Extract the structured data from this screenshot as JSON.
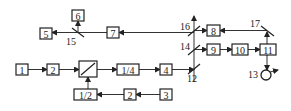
{
  "diagram": {
    "boxes": [
      {
        "id": "b1",
        "label": "1",
        "x": 16,
        "y": 64,
        "w": 12,
        "h": 11
      },
      {
        "id": "b2a",
        "label": "2",
        "x": 47,
        "y": 64,
        "w": 12,
        "h": 11
      },
      {
        "id": "b_pol",
        "label": "",
        "x": 79,
        "y": 61,
        "w": 18,
        "h": 16
      },
      {
        "id": "b_q",
        "label": "1/4",
        "x": 117,
        "y": 64,
        "w": 22,
        "h": 11
      },
      {
        "id": "b4",
        "label": "4",
        "x": 160,
        "y": 64,
        "w": 12,
        "h": 11
      },
      {
        "id": "b_h",
        "label": "1/2",
        "x": 74,
        "y": 89,
        "w": 23,
        "h": 11
      },
      {
        "id": "b2b",
        "label": "2",
        "x": 124,
        "y": 89,
        "w": 12,
        "h": 11
      },
      {
        "id": "b3",
        "label": "3",
        "x": 160,
        "y": 89,
        "w": 12,
        "h": 11
      },
      {
        "id": "b5",
        "label": "5",
        "x": 40,
        "y": 28,
        "w": 12,
        "h": 11
      },
      {
        "id": "b6",
        "label": "6",
        "x": 72,
        "y": 10,
        "w": 12,
        "h": 11
      },
      {
        "id": "b7",
        "label": "7",
        "x": 107,
        "y": 27,
        "w": 12,
        "h": 11
      },
      {
        "id": "b8",
        "label": "8",
        "x": 207,
        "y": 25,
        "w": 13,
        "h": 11
      },
      {
        "id": "b9",
        "label": "9",
        "x": 207,
        "y": 44,
        "w": 13,
        "h": 11
      },
      {
        "id": "b10",
        "label": "10",
        "x": 232,
        "y": 44,
        "w": 16,
        "h": 11
      },
      {
        "id": "b11",
        "label": "11",
        "x": 260,
        "y": 44,
        "w": 16,
        "h": 11
      }
    ],
    "labels": [
      {
        "id": "l12",
        "text": "12",
        "x": 187,
        "y": 82
      },
      {
        "id": "l13",
        "text": "13",
        "x": 248,
        "y": 78
      },
      {
        "id": "l14",
        "text": "14",
        "x": 180,
        "y": 50
      },
      {
        "id": "l15",
        "text": "15",
        "x": 66,
        "y": 45
      },
      {
        "id": "l16",
        "text": "16",
        "x": 180,
        "y": 30
      },
      {
        "id": "l17",
        "text": "17",
        "x": 250,
        "y": 27
      }
    ]
  }
}
